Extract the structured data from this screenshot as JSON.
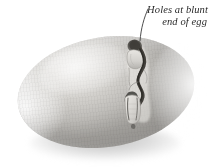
{
  "figure": {
    "colorspace": "grayscale",
    "background_color": "#ffffff"
  },
  "annotation": {
    "line1": "Holes at blunt",
    "line2": "end of egg",
    "full_text": "Holes at blunt end of egg",
    "text_color": "#2a2a2a",
    "leader_line_color": "#3a3a3a"
  },
  "specimen": {
    "name": "egg",
    "shell_color": "#cfcdc9",
    "shadow_color": "#a0a0a0",
    "damage_label": "holes",
    "damage_location": "blunt end",
    "hole_count": 2,
    "crack_color": "#4a4844"
  }
}
